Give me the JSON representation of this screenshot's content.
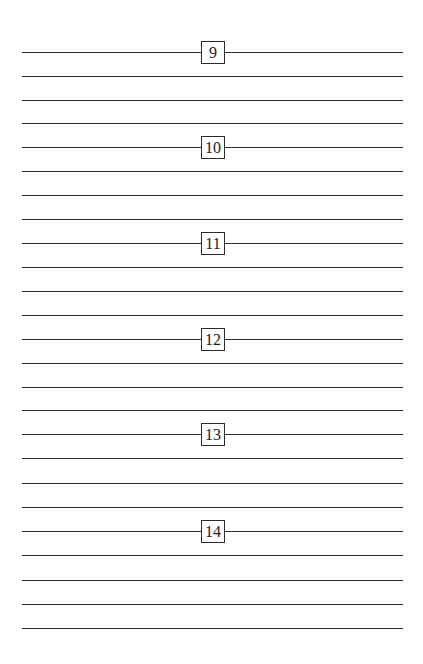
{
  "page": {
    "sections": [
      {
        "number": "9",
        "line_y": 52
      },
      {
        "number": "10",
        "line_y": 147
      },
      {
        "number": "11",
        "line_y": 243
      },
      {
        "number": "12",
        "line_y": 339
      },
      {
        "number": "13",
        "line_y": 434
      },
      {
        "number": "14",
        "line_y": 531
      }
    ],
    "line_spacing": 24,
    "plain_lines_per_section": 3,
    "final_line_y": 628
  }
}
